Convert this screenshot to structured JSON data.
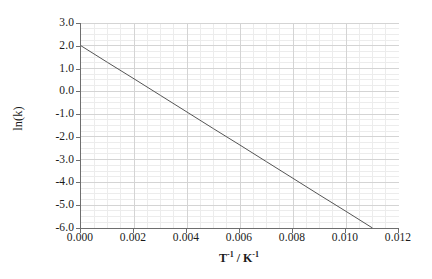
{
  "chart_data": {
    "type": "line",
    "title": "",
    "subtitle": "",
    "xlabel_plain": "T-1 / K-1",
    "xlabel_base": "T",
    "xlabel_exp": "-1",
    "xlabel_sep": " / K",
    "xlabel_exp2": "-1",
    "ylabel": "ln(k)",
    "xlim": [
      0.0,
      0.012
    ],
    "ylim": [
      -6.0,
      3.0
    ],
    "xticks": [
      0.0,
      0.002,
      0.004,
      0.006,
      0.008,
      0.01,
      0.012
    ],
    "xtick_labels": [
      "0.000",
      "0.002",
      "0.004",
      "0.006",
      "0.008",
      "0.010",
      "0.012"
    ],
    "yticks": [
      3.0,
      2.0,
      1.0,
      0.0,
      -1.0,
      -2.0,
      -3.0,
      -4.0,
      -5.0,
      -6.0
    ],
    "ytick_labels": [
      "3.0",
      "2.0",
      "1.0",
      "0.0",
      "-1.0",
      "-2.0",
      "-3.0",
      "-4.0",
      "-5.0",
      "-6.0"
    ],
    "grid": true,
    "minor_grid": true,
    "minor_divisions_x": 4,
    "minor_divisions_y": 4,
    "legend": null,
    "legend_position": "none",
    "series": [
      {
        "name": "Arrhenius fit",
        "x": [
          0.0,
          0.001,
          0.002,
          0.003,
          0.004,
          0.005,
          0.006,
          0.007,
          0.008,
          0.009,
          0.01,
          0.011
        ],
        "y": [
          2.0,
          1.27,
          0.55,
          -0.18,
          -0.91,
          -1.64,
          -2.36,
          -3.09,
          -3.82,
          -4.55,
          -5.27,
          -6.0
        ],
        "color": "#555555",
        "line_width": 1,
        "markers": false
      }
    ],
    "colors": {
      "line": "#555555",
      "axis": "#6e6e6e",
      "major_grid": "#d4d4d4",
      "minor_grid": "#ececec",
      "text": "#1a1a1a",
      "background": "#ffffff"
    }
  }
}
